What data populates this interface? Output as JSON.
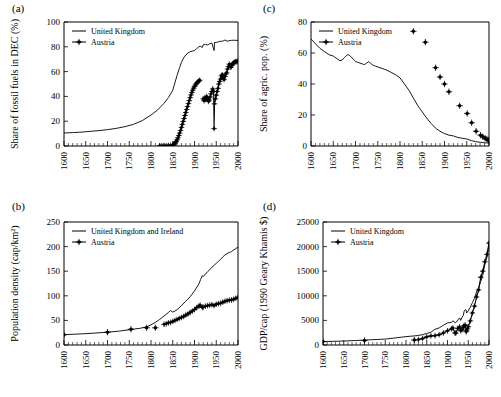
{
  "figure": {
    "background": "#ffffff",
    "series_color": "#000000",
    "panels": [
      "a",
      "b",
      "c",
      "d"
    ]
  },
  "chart_data": [
    {
      "panel": "a",
      "label": "(a)",
      "type": "line",
      "title": "",
      "xlabel": "",
      "ylabel": "Share of fossil fuels in DEC (%)",
      "xlim": [
        1600,
        2000
      ],
      "ylim": [
        0,
        100
      ],
      "xticks": [
        1600,
        1650,
        1700,
        1750,
        1800,
        1850,
        1900,
        1950,
        2000
      ],
      "yticks": [
        0,
        20,
        40,
        60,
        80,
        100
      ],
      "grid": false,
      "legend_position": "top-left",
      "series": [
        {
          "name": "United Kingdom",
          "style": "line",
          "x": [
            1600,
            1620,
            1640,
            1660,
            1680,
            1700,
            1720,
            1740,
            1760,
            1780,
            1800,
            1815,
            1830,
            1840,
            1850,
            1855,
            1860,
            1865,
            1870,
            1875,
            1880,
            1885,
            1890,
            1895,
            1900,
            1905,
            1910,
            1913,
            1918,
            1920,
            1925,
            1930,
            1935,
            1940,
            1945,
            1946,
            1950,
            1955,
            1960,
            1965,
            1970,
            1975,
            1980,
            1985,
            1990,
            1995,
            2000
          ],
          "y": [
            10.5,
            10.8,
            11.2,
            11.8,
            12.4,
            13.2,
            14.2,
            15.6,
            17.5,
            20.5,
            25.0,
            29.0,
            34.5,
            39.0,
            45.0,
            51.0,
            57.0,
            62.5,
            67.5,
            71.0,
            73.5,
            75.0,
            76.0,
            76.5,
            77.0,
            78.5,
            80.0,
            80.5,
            79.5,
            81.5,
            82.0,
            81.5,
            82.5,
            83.0,
            77.0,
            83.5,
            83.5,
            84.0,
            84.5,
            84.5,
            85.5,
            84.5,
            85.0,
            85.2,
            85.3,
            85.2,
            85.2
          ]
        },
        {
          "name": "Austria",
          "style": "line-marker",
          "x": [
            1820,
            1825,
            1830,
            1835,
            1840,
            1845,
            1850,
            1852,
            1854,
            1856,
            1858,
            1860,
            1862,
            1864,
            1866,
            1868,
            1870,
            1872,
            1874,
            1876,
            1878,
            1880,
            1882,
            1884,
            1886,
            1888,
            1890,
            1892,
            1894,
            1896,
            1898,
            1900,
            1902,
            1904,
            1906,
            1908,
            1910,
            1912
          ],
          "y": [
            0.2,
            0.2,
            0.3,
            0.3,
            0.4,
            0.5,
            0.8,
            1.2,
            1.8,
            2.6,
            3.6,
            5.0,
            6.6,
            8.4,
            10.4,
            12.6,
            15.0,
            17.4,
            19.8,
            22.2,
            24.6,
            27.0,
            29.4,
            31.8,
            34.2,
            36.6,
            39.0,
            41.2,
            43.2,
            45.0,
            46.6,
            48.0,
            49.2,
            50.2,
            51.0,
            51.8,
            52.4,
            53.0
          ]
        },
        {
          "name": "Austria",
          "style": "line-marker",
          "x": [
            1920,
            1922,
            1924,
            1926,
            1928,
            1930,
            1932,
            1934,
            1936,
            1938,
            1940,
            1942,
            1944,
            1945,
            1946,
            1948,
            1950,
            1952,
            1954,
            1956,
            1958,
            1960,
            1962,
            1964,
            1966,
            1968,
            1970,
            1972,
            1974,
            1976,
            1978,
            1980,
            1982,
            1984,
            1986,
            1988,
            1990,
            1992,
            1994,
            1996,
            1998,
            2000
          ],
          "y": [
            38.0,
            36.5,
            39.0,
            37.5,
            40.0,
            38.5,
            36.0,
            37.0,
            39.5,
            42.0,
            44.0,
            46.0,
            44.0,
            14.0,
            34.0,
            38.0,
            41.0,
            44.0,
            46.5,
            50.0,
            52.0,
            54.0,
            56.5,
            57.5,
            55.0,
            53.5,
            56.0,
            58.0,
            59.0,
            62.0,
            64.0,
            66.0,
            64.5,
            63.5,
            65.0,
            66.5,
            67.0,
            67.5,
            68.0,
            68.0,
            68.2,
            68.3
          ]
        }
      ]
    },
    {
      "panel": "b",
      "label": "(b)",
      "type": "line",
      "title": "",
      "xlabel": "",
      "ylabel": "Population density (cap/km²)",
      "xlim": [
        1600,
        2000
      ],
      "ylim": [
        0,
        250
      ],
      "xticks": [
        1600,
        1650,
        1700,
        1750,
        1800,
        1850,
        1900,
        1950,
        2000
      ],
      "yticks": [
        0,
        50,
        100,
        150,
        200,
        250
      ],
      "grid": false,
      "legend_position": "top-left",
      "series": [
        {
          "name": "United Kingdom and Ireland",
          "style": "line",
          "x": [
            1600,
            1650,
            1700,
            1725,
            1750,
            1775,
            1790,
            1800,
            1810,
            1820,
            1830,
            1840,
            1845,
            1850,
            1855,
            1860,
            1870,
            1880,
            1890,
            1900,
            1910,
            1914,
            1918,
            1920,
            1925,
            1930,
            1935,
            1940,
            1945,
            1950,
            1955,
            1960,
            1965,
            1970,
            1975,
            1980,
            1985,
            1990,
            1995,
            2000
          ],
          "y": [
            21,
            23,
            26,
            28,
            31,
            34,
            37,
            41,
            46,
            52,
            59,
            66,
            70,
            67,
            69,
            72,
            80,
            89,
            98,
            110,
            124,
            133,
            141,
            139,
            144,
            149,
            153,
            158,
            162,
            166,
            170,
            174,
            179,
            183,
            186,
            188,
            190,
            193,
            196,
            199
          ]
        },
        {
          "name": "Austria",
          "style": "marker-only",
          "x": [
            1600,
            1700,
            1754,
            1790,
            1810
          ],
          "y": [
            21,
            26,
            32,
            35,
            35
          ]
        },
        {
          "name": "Austria",
          "style": "line-marker",
          "x": [
            1830,
            1835,
            1840,
            1845,
            1850,
            1855,
            1860,
            1865,
            1870,
            1875,
            1880,
            1885,
            1890,
            1895,
            1900,
            1905,
            1910,
            1913,
            1918,
            1920,
            1925,
            1930,
            1935,
            1940,
            1945,
            1950,
            1955,
            1960,
            1965,
            1970,
            1975,
            1980,
            1985,
            1990,
            1995,
            2000
          ],
          "y": [
            42,
            43,
            45,
            46,
            48,
            50,
            52,
            54,
            56,
            58,
            61,
            63,
            66,
            69,
            72,
            76,
            79,
            81,
            76,
            77,
            79,
            80,
            81,
            82,
            80,
            83,
            84,
            85,
            87,
            89,
            90,
            91,
            91.5,
            93,
            95,
            97
          ]
        }
      ]
    },
    {
      "panel": "c",
      "label": "(c)",
      "type": "line",
      "title": "",
      "xlabel": "",
      "ylabel": "Share of agric. pop. (%)",
      "xlim": [
        1600,
        2000
      ],
      "ylim": [
        0,
        80
      ],
      "xticks": [
        1600,
        1650,
        1700,
        1750,
        1800,
        1850,
        1900,
        1950,
        2000
      ],
      "yticks": [
        0,
        20,
        40,
        60,
        80
      ],
      "grid": false,
      "legend_position": "top-left",
      "series": [
        {
          "name": "United Kingdom",
          "style": "line",
          "x": [
            1600,
            1610,
            1620,
            1630,
            1640,
            1650,
            1660,
            1665,
            1670,
            1675,
            1680,
            1685,
            1690,
            1695,
            1700,
            1705,
            1710,
            1715,
            1720,
            1725,
            1730,
            1735,
            1740,
            1745,
            1750,
            1755,
            1760,
            1765,
            1770,
            1780,
            1790,
            1800,
            1810,
            1820,
            1830,
            1840,
            1850,
            1860,
            1870,
            1880,
            1890,
            1900,
            1910,
            1920,
            1930,
            1940,
            1950,
            1960,
            1970,
            1980,
            1990,
            2000
          ],
          "y": [
            69,
            66,
            63,
            61,
            59,
            58,
            56,
            55,
            55.5,
            57,
            58.5,
            59,
            57.5,
            56,
            54.5,
            54,
            53.5,
            53,
            52.5,
            53.5,
            54.5,
            53,
            52,
            51.5,
            51,
            50.5,
            50,
            49.5,
            49,
            47.5,
            46,
            44,
            40,
            36,
            31,
            26,
            22,
            18,
            14.5,
            11.5,
            9.5,
            8,
            7,
            6.5,
            5.5,
            5,
            4.5,
            3.5,
            2.8,
            2.4,
            2.1,
            1.9
          ]
        },
        {
          "name": "Austria",
          "style": "marker-only",
          "x": [
            1830,
            1857,
            1880,
            1890,
            1900,
            1910,
            1934,
            1951,
            1961,
            1971,
            1981,
            1986,
            1991,
            1995,
            1998,
            2000
          ],
          "y": [
            74,
            67,
            50.5,
            44.5,
            40,
            35,
            26,
            21,
            15,
            9.5,
            7,
            6,
            5,
            4.5,
            4,
            3.5
          ]
        }
      ]
    },
    {
      "panel": "d",
      "label": "(d)",
      "type": "line",
      "title": "",
      "xlabel": "",
      "ylabel": "GDP/cap (1990 Geary Khamis $)",
      "xlim": [
        1600,
        2000
      ],
      "ylim": [
        0,
        25000
      ],
      "xticks": [
        1600,
        1650,
        1700,
        1750,
        1800,
        1850,
        1900,
        1950,
        2000
      ],
      "yticks": [
        0,
        5000,
        10000,
        15000,
        20000,
        25000
      ],
      "grid": false,
      "legend_position": "top-left",
      "series": [
        {
          "name": "United Kingdom",
          "style": "line",
          "x": [
            1600,
            1650,
            1700,
            1750,
            1800,
            1820,
            1830,
            1840,
            1850,
            1860,
            1870,
            1880,
            1890,
            1900,
            1910,
            1913,
            1918,
            1920,
            1925,
            1929,
            1932,
            1935,
            1938,
            1940,
            1943,
            1945,
            1946,
            1950,
            1955,
            1960,
            1965,
            1970,
            1975,
            1980,
            1985,
            1990,
            1995,
            2000,
            2003
          ],
          "y": [
            700,
            800,
            1000,
            1200,
            1700,
            1850,
            1950,
            2100,
            2330,
            2600,
            3200,
            3480,
            4010,
            4490,
            4610,
            4920,
            4550,
            4550,
            5100,
            5500,
            5000,
            5600,
            6000,
            6850,
            7200,
            7050,
            6500,
            6940,
            7700,
            8600,
            9500,
            10770,
            11700,
            12900,
            14200,
            16400,
            17800,
            20200,
            21000
          ]
        },
        {
          "name": "Austria",
          "style": "marker-only",
          "x": [
            1600,
            1700,
            1820
          ],
          "y": [
            700,
            900,
            1000
          ]
        },
        {
          "name": "Austria",
          "style": "line-marker",
          "x": [
            1830,
            1840,
            1850,
            1860,
            1870,
            1880,
            1890,
            1900,
            1910,
            1913,
            1918,
            1920,
            1925,
            1929,
            1932,
            1935,
            1938,
            1940,
            1943,
            1945,
            1946,
            1948,
            1950,
            1955,
            1960,
            1965,
            1970,
            1975,
            1980,
            1985,
            1990,
            1995,
            2000,
            2003
          ],
          "y": [
            1100,
            1300,
            1650,
            1850,
            1900,
            2100,
            2450,
            2880,
            3290,
            3460,
            2450,
            2410,
            3370,
            3700,
            2900,
            3100,
            3580,
            3960,
            4050,
            2700,
            2900,
            3300,
            3710,
            4900,
            6520,
            7900,
            9750,
            11200,
            13760,
            15000,
            16900,
            18400,
            20700,
            20900
          ]
        }
      ]
    }
  ]
}
